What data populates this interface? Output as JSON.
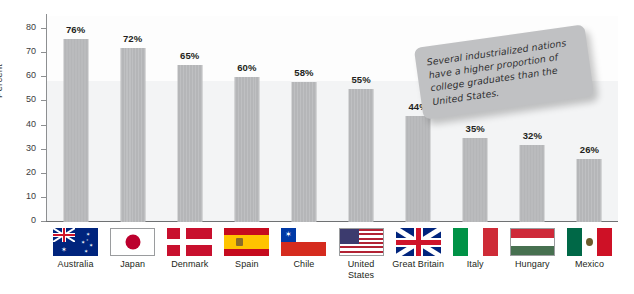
{
  "chart_data": {
    "type": "bar",
    "title": "",
    "xlabel": "",
    "ylabel": "Percent",
    "ylim": [
      0,
      85
    ],
    "yticks": [
      0,
      10,
      20,
      30,
      40,
      50,
      60,
      70,
      80
    ],
    "ytick_labels": [
      "0",
      "10",
      "20",
      "30",
      "40",
      "50",
      "60",
      "70",
      "80"
    ],
    "grid": false,
    "legend": "none",
    "categories": [
      "Australia",
      "Japan",
      "Denmark",
      "Spain",
      "Chile",
      "United States",
      "Great Britain",
      "Italy",
      "Hungary",
      "Mexico"
    ],
    "values": [
      76,
      72,
      65,
      60,
      58,
      55,
      44,
      35,
      32,
      26
    ],
    "data_labels": [
      "76%",
      "72%",
      "65%",
      "60%",
      "58%",
      "55%",
      "44%",
      "35%",
      "32%",
      "26%"
    ],
    "bar_color": "#b5b6b8",
    "plot_band_color": "#f3f4f5",
    "annotations": [
      {
        "id": "callout",
        "text": "Several industrialized nations have a higher proportion of college graduates than the United States.",
        "lines": [
          "Several industrialized nations",
          "have a higher proportion of",
          "college graduates than the",
          "United States."
        ],
        "background": "#c0c1c3",
        "rotation_deg": -8
      }
    ]
  },
  "axis": {
    "y_label": "Percent",
    "ticks": [
      "80",
      "70",
      "60",
      "50",
      "40",
      "30",
      "20",
      "10",
      "0"
    ]
  },
  "countries": [
    {
      "name": "Australia",
      "name_lines": [
        "Australia"
      ],
      "value_label": "76%",
      "flag": "flag-australia"
    },
    {
      "name": "Japan",
      "name_lines": [
        "Japan"
      ],
      "value_label": "72%",
      "flag": "flag-japan"
    },
    {
      "name": "Denmark",
      "name_lines": [
        "Denmark"
      ],
      "value_label": "65%",
      "flag": "flag-denmark"
    },
    {
      "name": "Spain",
      "name_lines": [
        "Spain"
      ],
      "value_label": "60%",
      "flag": "flag-spain"
    },
    {
      "name": "Chile",
      "name_lines": [
        "Chile"
      ],
      "value_label": "58%",
      "flag": "flag-chile"
    },
    {
      "name": "United States",
      "name_lines": [
        "United",
        "States"
      ],
      "value_label": "55%",
      "flag": "flag-united-states"
    },
    {
      "name": "Great Britain",
      "name_lines": [
        "Great Britain"
      ],
      "value_label": "44%",
      "flag": "flag-great-britain"
    },
    {
      "name": "Italy",
      "name_lines": [
        "Italy"
      ],
      "value_label": "35%",
      "flag": "flag-italy"
    },
    {
      "name": "Hungary",
      "name_lines": [
        "Hungary"
      ],
      "value_label": "32%",
      "flag": "flag-hungary"
    },
    {
      "name": "Mexico",
      "name_lines": [
        "Mexico"
      ],
      "value_label": "26%",
      "flag": "flag-mexico"
    }
  ],
  "callout": {
    "line1": "Several industrialized nations",
    "line2": "have a higher proportion of",
    "line3": "college graduates than the",
    "line4": "United States."
  },
  "caption": {
    "text": ""
  }
}
